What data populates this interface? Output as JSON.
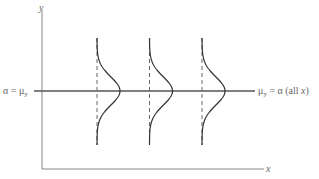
{
  "diagram": {
    "axis_labels": {
      "y": "y",
      "x": "x"
    },
    "left_label": "α = μ",
    "left_label_sub": "y",
    "right_label_prefix": "μ",
    "right_label_sub": "y",
    "right_label_suffix": " = α (all ",
    "right_label_var": "x",
    "right_label_close": ")",
    "distributions_count": 3,
    "colors": {
      "axis": "#777777",
      "mean_line": "#555555",
      "curve": "#333333",
      "dashed": "#666666",
      "text": "#666666"
    }
  }
}
